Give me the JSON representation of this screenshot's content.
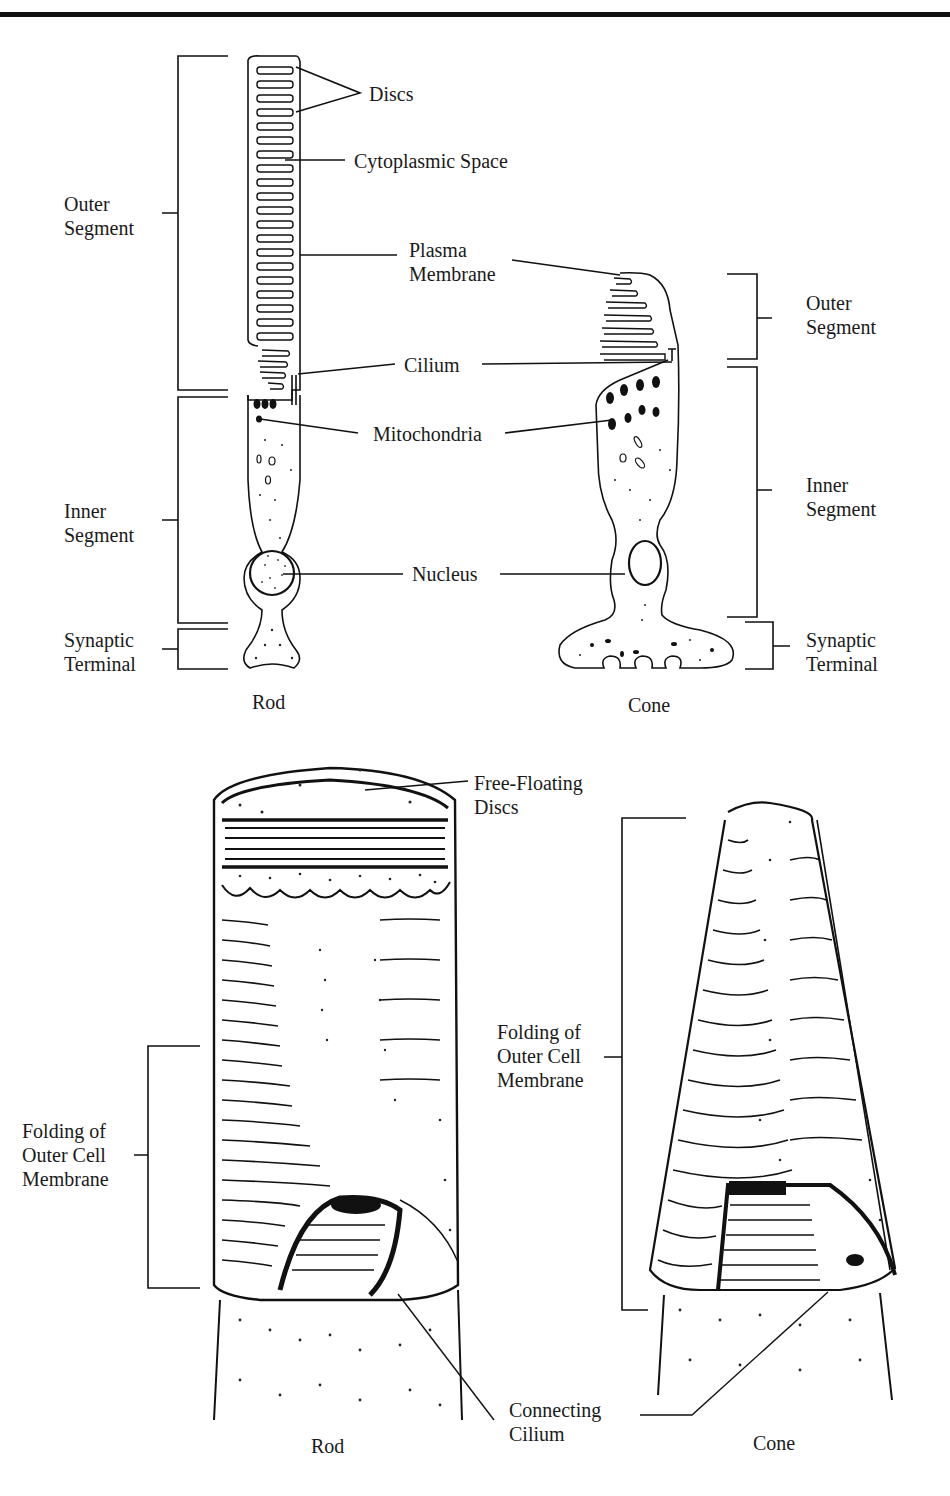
{
  "header": {
    "fragment": "p"
  },
  "top_figure": {
    "rod": {
      "caption": "Rod",
      "regions": [
        {
          "name": "outer-segment",
          "label": "Outer\nSegment"
        },
        {
          "name": "inner-segment",
          "label": "Inner\nSegment"
        },
        {
          "name": "synaptic-terminal",
          "label": "Synaptic\nTerminal"
        }
      ]
    },
    "cone": {
      "caption": "Cone",
      "regions": [
        {
          "name": "outer-segment",
          "label": "Outer\nSegment"
        },
        {
          "name": "inner-segment",
          "label": "Inner\nSegment"
        },
        {
          "name": "synaptic-terminal",
          "label": "Synaptic\nTerminal"
        }
      ]
    },
    "center_labels": {
      "discs": "Discs",
      "cytoplasmic_space": "Cytoplasmic Space",
      "plasma_membrane": "Plasma\nMembrane",
      "cilium": "Cilium",
      "mitochondria": "Mitochondria",
      "nucleus": "Nucleus"
    }
  },
  "bottom_figure": {
    "rod": {
      "caption": "Rod",
      "folding_label": "Folding of\nOuter Cell\nMembrane"
    },
    "cone": {
      "caption": "Cone",
      "folding_label": "Folding of\nOuter Cell\nMembrane"
    },
    "free_floating_discs": "Free-Floating\nDiscs",
    "connecting_cilium": "Connecting\nCilium"
  }
}
